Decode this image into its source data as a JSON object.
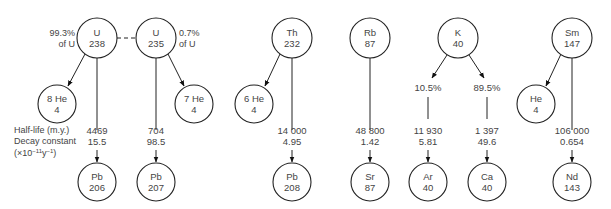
{
  "diagram": {
    "legend": {
      "line1": "Half-life (m.y.)",
      "line2": "Decay constant",
      "line3": "(×10",
      "line3_exp1": "−11",
      "line3_mid": "y",
      "line3_exp2": "−1",
      "line3_end": ")"
    },
    "nodes": [
      {
        "id": "U238",
        "element": "U",
        "mass": "238",
        "cx": 97,
        "cy": 38,
        "r": 20
      },
      {
        "id": "U235",
        "element": "U",
        "mass": "235",
        "cx": 156,
        "cy": 38,
        "r": 20
      },
      {
        "id": "He8",
        "element": "8 He",
        "mass": "4",
        "cx": 57,
        "cy": 104,
        "r": 19
      },
      {
        "id": "He7",
        "element": "7 He",
        "mass": "4",
        "cx": 194,
        "cy": 104,
        "r": 19
      },
      {
        "id": "Pb206",
        "element": "Pb",
        "mass": "206",
        "cx": 97,
        "cy": 182,
        "r": 19
      },
      {
        "id": "Pb207",
        "element": "Pb",
        "mass": "207",
        "cx": 156,
        "cy": 182,
        "r": 19
      },
      {
        "id": "Th232",
        "element": "Th",
        "mass": "232",
        "cx": 292,
        "cy": 38,
        "r": 20
      },
      {
        "id": "He6",
        "element": "6 He",
        "mass": "4",
        "cx": 254,
        "cy": 104,
        "r": 19
      },
      {
        "id": "Pb208",
        "element": "Pb",
        "mass": "208",
        "cx": 292,
        "cy": 182,
        "r": 19
      },
      {
        "id": "Rb87",
        "element": "Rb",
        "mass": "87",
        "cx": 370,
        "cy": 38,
        "r": 20
      },
      {
        "id": "Sr87",
        "element": "Sr",
        "mass": "87",
        "cx": 370,
        "cy": 182,
        "r": 19
      },
      {
        "id": "K40",
        "element": "K",
        "mass": "40",
        "cx": 458,
        "cy": 38,
        "r": 20
      },
      {
        "id": "Ar40",
        "element": "Ar",
        "mass": "40",
        "cx": 428,
        "cy": 182,
        "r": 19
      },
      {
        "id": "Ca40",
        "element": "Ca",
        "mass": "40",
        "cx": 487,
        "cy": 182,
        "r": 19
      },
      {
        "id": "Sm147",
        "element": "Sm",
        "mass": "147",
        "cx": 572,
        "cy": 38,
        "r": 20
      },
      {
        "id": "He4",
        "element": "He",
        "mass": "4",
        "cx": 536,
        "cy": 104,
        "r": 19
      },
      {
        "id": "Nd143",
        "element": "Nd",
        "mass": "143",
        "cx": 572,
        "cy": 182,
        "r": 19
      }
    ],
    "abundance_labels": [
      {
        "line1": "99.3%",
        "line2": "of U",
        "x": 75,
        "y": 35,
        "anchor": "end"
      },
      {
        "line1": "0.7%",
        "line2": "of U",
        "x": 179,
        "y": 35,
        "anchor": "start"
      }
    ],
    "decays": [
      {
        "from": "U238",
        "to": "Pb206",
        "half_life": "4469",
        "decay_constant": "15.5",
        "x": 97
      },
      {
        "from": "U235",
        "to": "Pb207",
        "half_life": "704",
        "decay_constant": "98.5",
        "x": 156
      },
      {
        "from": "Th232",
        "to": "Pb208",
        "half_life": "14 000",
        "decay_constant": "4.95",
        "x": 292
      },
      {
        "from": "Rb87",
        "to": "Sr87",
        "half_life": "48 800",
        "decay_constant": "1.42",
        "x": 370
      },
      {
        "from": "K40",
        "to": "Ar40",
        "half_life": "11 930",
        "decay_constant": "5.81",
        "x": 428,
        "branch_pct": "10.5%"
      },
      {
        "from": "K40",
        "to": "Ca40",
        "half_life": "1 397",
        "decay_constant": "49.6",
        "x": 487,
        "branch_pct": "89.5%"
      },
      {
        "from": "Sm147",
        "to": "Nd143",
        "half_life": "106 000",
        "decay_constant": "0.654",
        "x": 572
      }
    ],
    "alpha_emissions": [
      {
        "from": "U238",
        "to": "He8"
      },
      {
        "from": "U235",
        "to": "He7"
      },
      {
        "from": "Th232",
        "to": "He6"
      },
      {
        "from": "Sm147",
        "to": "He4"
      }
    ]
  }
}
